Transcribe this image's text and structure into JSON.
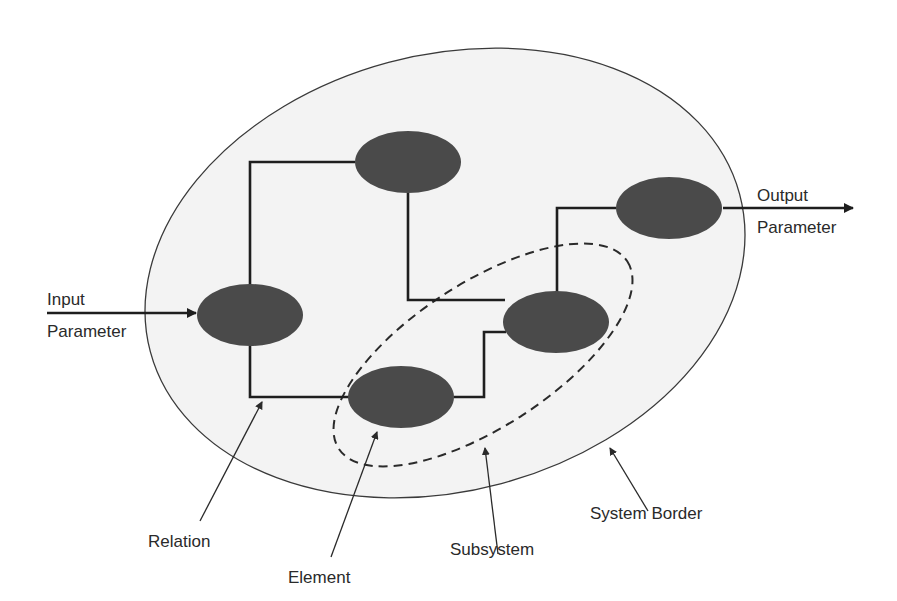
{
  "diagram": {
    "type": "system-model",
    "colors": {
      "background": "#ffffff",
      "system_fill": "#f3f3f3",
      "element_fill": "#4a4a4a",
      "line": "#1e1e1e"
    },
    "input": {
      "line1": "Input",
      "line2": "Parameter"
    },
    "output": {
      "line1": "Output",
      "line2": "Parameter"
    },
    "callouts": {
      "relation": "Relation",
      "element": "Element",
      "subsystem": "Subsystem",
      "system_border": "System Border"
    },
    "elements": [
      {
        "id": "top",
        "cx": 408,
        "cy": 162
      },
      {
        "id": "left",
        "cx": 250,
        "cy": 315
      },
      {
        "id": "output",
        "cx": 669,
        "cy": 208
      },
      {
        "id": "middle-right",
        "cx": 556,
        "cy": 322
      },
      {
        "id": "bottom",
        "cx": 401,
        "cy": 397
      }
    ],
    "element_count": 5,
    "subsystem_element_count": 2
  }
}
